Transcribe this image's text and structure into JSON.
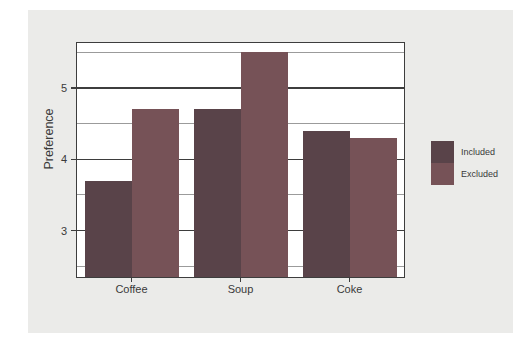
{
  "figure": {
    "panel_bg": "#ebebe9",
    "plot_bg": "#ffffff",
    "plot_border_color": "#3d3d3d",
    "major_grid_color": "#3d3d3d",
    "minor_grid_color": "#9b9b9b",
    "text_color": "#3a3a3a"
  },
  "chart_data": {
    "type": "bar",
    "categories": [
      "Coffee",
      "Soup",
      "Coke"
    ],
    "series": [
      {
        "name": "Included",
        "values": [
          3.7,
          4.7,
          4.4
        ],
        "color": "#594349"
      },
      {
        "name": "Excluded",
        "values": [
          4.7,
          5.5,
          4.3
        ],
        "color": "#765257"
      }
    ],
    "title": "",
    "xlabel": "",
    "ylabel": "Preference",
    "ylim": [
      2.35,
      5.63
    ],
    "y_major_ticks": [
      3,
      4,
      5
    ],
    "y_minor_ticks": [
      2.5,
      3.5,
      4.5,
      5.5
    ],
    "grid": "horizontal-behind-bars",
    "legend_position": "right",
    "bar_width_px": 47
  }
}
